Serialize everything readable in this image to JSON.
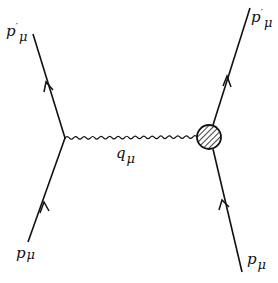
{
  "diagram": {
    "type": "feynman-diagram",
    "stroke_color": "#111111",
    "background": "#ffffff",
    "labels": {
      "incoming_left": {
        "base": "p",
        "sub": "μ",
        "sup": ""
      },
      "outgoing_left": {
        "base": "p",
        "sub": "μ",
        "sup": "′"
      },
      "propagator": {
        "base": "q",
        "sub": "μ",
        "sup": ""
      },
      "incoming_right": {
        "base": "p",
        "sub": "μ",
        "sup": ""
      },
      "outgoing_right": {
        "base": "p",
        "sub": "μ",
        "sup": "′"
      }
    },
    "vertices": {
      "left": {
        "x": 65,
        "y": 138,
        "kind": "point"
      },
      "right": {
        "x": 209,
        "y": 137,
        "kind": "hatched-blob",
        "radius": 12
      }
    },
    "lines": [
      {
        "name": "incoming-left-fermion",
        "from": [
          28,
          242
        ],
        "to": [
          65,
          138
        ],
        "arrow_at": [
          44,
          207
        ]
      },
      {
        "name": "outgoing-left-fermion",
        "from": [
          65,
          138
        ],
        "to": [
          33,
          34
        ],
        "arrow_at": [
          49,
          88
        ]
      },
      {
        "name": "incoming-right-fermion",
        "from": [
          242,
          272
        ],
        "to": [
          213,
          149
        ],
        "arrow_at": [
          224,
          205
        ]
      },
      {
        "name": "outgoing-right-fermion",
        "from": [
          213,
          125
        ],
        "to": [
          250,
          8
        ],
        "arrow_at": [
          228,
          81
        ]
      }
    ],
    "propagator": {
      "name": "photon-wavy-line",
      "from": [
        65,
        138
      ],
      "to": [
        197,
        137
      ]
    }
  }
}
